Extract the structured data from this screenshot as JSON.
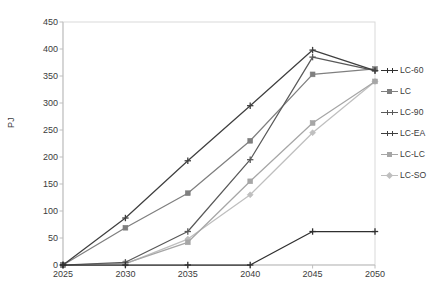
{
  "chart_data": {
    "type": "line",
    "title": "",
    "xlabel": "",
    "ylabel": "PJ",
    "x": [
      2025,
      2030,
      2035,
      2040,
      2045,
      2050
    ],
    "xticklabels": [
      "2025",
      "2030",
      "2035",
      "2040",
      "2045",
      "2050"
    ],
    "yticklabels": [
      "0",
      "50",
      "100",
      "150",
      "200",
      "250",
      "300",
      "350",
      "400",
      "450"
    ],
    "ylim": [
      0,
      450
    ],
    "ytick_step": 50,
    "xlim": [
      2025,
      2050
    ],
    "grid": false,
    "legend_position": "right",
    "series": [
      {
        "name": "LC-60",
        "color": "#2f2f2f",
        "marker": "plus",
        "values": [
          0,
          0,
          0,
          0,
          62,
          62
        ]
      },
      {
        "name": "LC",
        "color": "#7f7f7f",
        "marker": "square",
        "values": [
          0,
          69,
          133,
          230,
          353,
          363
        ]
      },
      {
        "name": "LC-90",
        "color": "#595959",
        "marker": "plus",
        "values": [
          0,
          5,
          62,
          195,
          385,
          360
        ]
      },
      {
        "name": "LC-EA",
        "color": "#3f3f3f",
        "marker": "plus",
        "values": [
          0,
          87,
          193,
          295,
          398,
          360
        ]
      },
      {
        "name": "LC-LC",
        "color": "#a6a6a6",
        "marker": "square",
        "values": [
          0,
          3,
          42,
          155,
          263,
          340
        ]
      },
      {
        "name": "LC-SO",
        "color": "#bfbfbf",
        "marker": "diamond",
        "values": [
          0,
          2,
          48,
          130,
          245,
          340
        ]
      }
    ]
  },
  "axes": {
    "y_axis_title": "PJ"
  }
}
